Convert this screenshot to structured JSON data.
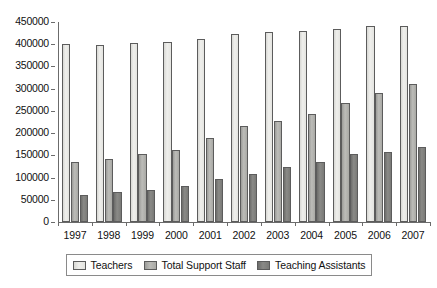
{
  "chart_data": {
    "type": "bar",
    "title": "",
    "xlabel": "",
    "ylabel": "",
    "categories": [
      "1997",
      "1998",
      "1999",
      "2000",
      "2001",
      "2002",
      "2003",
      "2004",
      "2005",
      "2006",
      "2007"
    ],
    "series": [
      {
        "name": "Teachers",
        "color": "#e8e8e4",
        "values": [
          401000,
          398000,
          402000,
          406000,
          412000,
          423000,
          427000,
          430000,
          435000,
          440000,
          440000
        ]
      },
      {
        "name": "Total Support Staff",
        "color": "#b4b4b0",
        "values": [
          134000,
          141000,
          152000,
          163000,
          188000,
          216000,
          227000,
          243000,
          268000,
          291000,
          310000
        ]
      },
      {
        "name": "Teaching Assistants",
        "color": "#808080",
        "values": [
          60000,
          68000,
          72000,
          82000,
          97000,
          108000,
          124000,
          136000,
          153000,
          158000,
          168000
        ]
      }
    ],
    "ylim": [
      0,
      450000
    ],
    "ytick_step": 50000,
    "yticks": [
      0,
      50000,
      100000,
      150000,
      200000,
      250000,
      300000,
      350000,
      400000,
      450000
    ],
    "ytick_labels": [
      "0",
      "50000",
      "100000",
      "150000",
      "200000",
      "250000",
      "300000",
      "350000",
      "400000",
      "450000"
    ],
    "grid": false,
    "legend_position": "bottom"
  }
}
